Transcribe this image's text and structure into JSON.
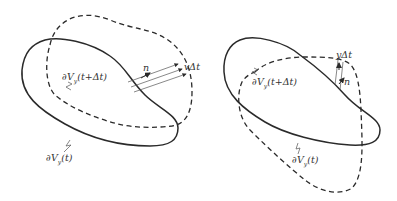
{
  "diagram": {
    "colors": {
      "stroke": "#2a2a2a",
      "label": "#333333",
      "background": "#ffffff"
    },
    "left_panel": {
      "solid_curve_label": "∂V",
      "solid_curve_sub": "y",
      "solid_curve_arg": "(t)",
      "dashed_curve_label": "∂V",
      "dashed_curve_sub": "y",
      "dashed_curve_arg": "(t+Δt)",
      "normal_label": "n",
      "displacement_label": "vΔt"
    },
    "right_panel": {
      "solid_curve_label": "∂V",
      "solid_curve_sub": "y",
      "solid_curve_arg": "(t+Δt)",
      "dashed_curve_label": "∂V",
      "dashed_curve_sub": "y",
      "dashed_curve_arg": "(t)",
      "normal_label": "n",
      "displacement_label": "yΔt"
    }
  }
}
